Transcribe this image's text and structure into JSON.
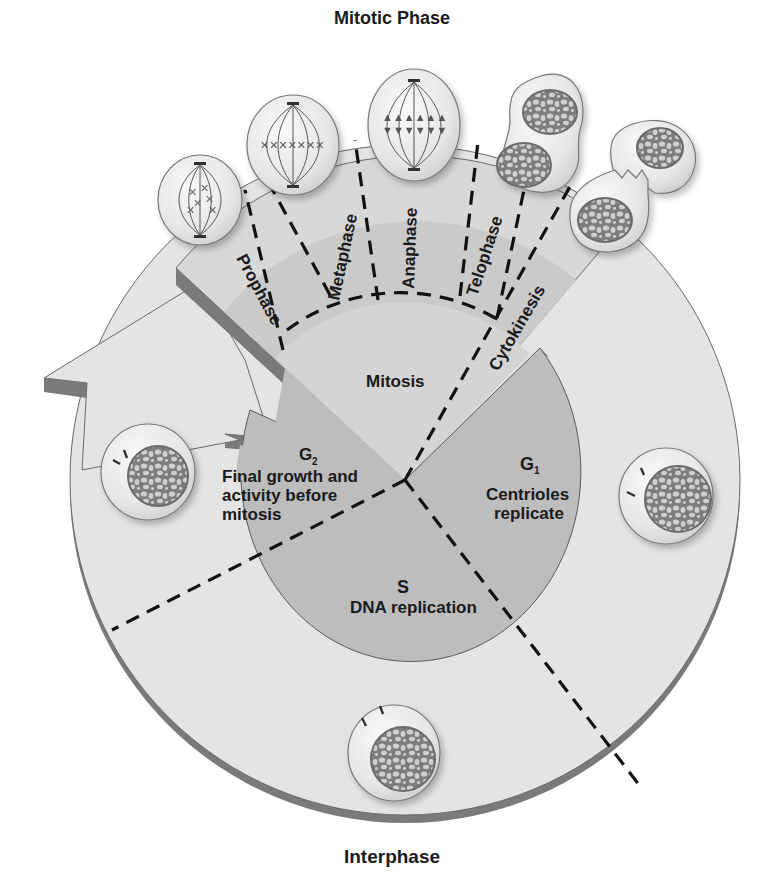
{
  "title": "Mitotic Phase",
  "bottom_label": "Interphase",
  "mitotic_stages": [
    {
      "label": "Prophase"
    },
    {
      "label": "Metaphase"
    },
    {
      "label": "Anaphase"
    },
    {
      "label": "Telophase"
    },
    {
      "label": "Cytokinesis"
    }
  ],
  "center_sectors": {
    "mitosis": {
      "label": "Mitosis"
    },
    "g2": {
      "label": "G",
      "sub": "2",
      "desc_lines": [
        "Final growth and",
        "activity before",
        "mitosis"
      ]
    },
    "g1": {
      "label": "G",
      "sub": "1",
      "desc_lines": [
        "Centrioles",
        "replicate"
      ]
    },
    "s": {
      "label": "S",
      "desc_lines": [
        "DNA replication"
      ]
    }
  },
  "colors": {
    "ring_light": "#e4e4e4",
    "ring_edge": "#7a7a7a",
    "inner_disc": "#bdbdbd",
    "wedge_light": "#d6d6d6",
    "wedge_mid": "#c8c8c8",
    "cell_fill": "#ededed",
    "nucleus": "#8a8a8a",
    "text": "#1a1a1a"
  }
}
